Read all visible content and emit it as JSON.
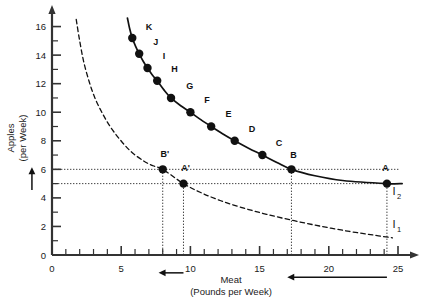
{
  "chart_data": {
    "type": "line",
    "title": "",
    "xlabel": "Meat",
    "xlabel_sub": "(Pounds per Week)",
    "ylabel": "Apples",
    "ylabel_sub": "(per Week)",
    "xlim": [
      0,
      25
    ],
    "ylim": [
      0,
      16.6
    ],
    "x_ticks_major": [
      0,
      5,
      10,
      15,
      20,
      25
    ],
    "x_tick_labels": [
      "0",
      "5",
      "10",
      "15",
      "20",
      "25"
    ],
    "x_tick_step_minor": 1,
    "y_ticks_major": [
      0,
      2,
      4,
      6,
      8,
      10,
      12,
      14,
      16
    ],
    "y_tick_labels": [
      "0",
      "2",
      "4",
      "6",
      "8",
      "10",
      "12",
      "14",
      "16"
    ],
    "y_tick_step_minor": 1,
    "grid": false,
    "legend": "none",
    "series": [
      {
        "name": "I2",
        "label": "I",
        "label_sub": "2",
        "style": "solid",
        "color": "#111111",
        "label_x": 24.6,
        "label_y": 4.2,
        "path": [
          [
            5.45,
            16.6
          ],
          [
            5.6,
            15.9
          ],
          [
            5.8,
            15.2
          ],
          [
            6.05,
            14.6
          ],
          [
            6.3,
            14.1
          ],
          [
            6.6,
            13.55
          ],
          [
            6.9,
            13.1
          ],
          [
            7.25,
            12.6
          ],
          [
            7.6,
            12.2
          ],
          [
            8.1,
            11.55
          ],
          [
            8.6,
            11.0
          ],
          [
            9.3,
            10.45
          ],
          [
            10.0,
            10.0
          ],
          [
            10.75,
            9.48
          ],
          [
            11.5,
            9.0
          ],
          [
            12.35,
            8.48
          ],
          [
            13.2,
            8.0
          ],
          [
            14.2,
            7.48
          ],
          [
            15.2,
            7.0
          ],
          [
            16.25,
            6.48
          ],
          [
            17.3,
            6.0
          ],
          [
            19.0,
            5.55
          ],
          [
            21.0,
            5.22
          ],
          [
            24.2,
            5.0
          ],
          [
            25.3,
            5.0
          ]
        ],
        "points": [
          {
            "label": "K",
            "x": 5.8,
            "y": 15.2,
            "lx": 7.0,
            "ly": 15.75
          },
          {
            "label": "J",
            "x": 6.3,
            "y": 14.1,
            "lx": 7.5,
            "ly": 14.7
          },
          {
            "label": "I",
            "x": 6.9,
            "y": 13.1,
            "lx": 8.1,
            "ly": 13.7
          },
          {
            "label": "H",
            "x": 7.6,
            "y": 12.2,
            "lx": 8.85,
            "ly": 12.8
          },
          {
            "label": "G",
            "x": 8.6,
            "y": 11.0,
            "lx": 9.95,
            "ly": 11.65
          },
          {
            "label": "F",
            "x": 10.0,
            "y": 10.0,
            "lx": 11.2,
            "ly": 10.65
          },
          {
            "label": "E",
            "x": 11.5,
            "y": 9.0,
            "lx": 12.75,
            "ly": 9.65
          },
          {
            "label": "D",
            "x": 13.2,
            "y": 8.0,
            "lx": 14.45,
            "ly": 8.65
          },
          {
            "label": "C",
            "x": 15.2,
            "y": 7.0,
            "lx": 16.4,
            "ly": 7.65
          },
          {
            "label": "B",
            "x": 17.3,
            "y": 6.0,
            "lx": 17.45,
            "ly": 6.8
          },
          {
            "label": "A",
            "x": 24.2,
            "y": 5.0,
            "lx": 24.1,
            "ly": 5.85
          }
        ]
      },
      {
        "name": "I1",
        "label": "I",
        "label_sub": "1",
        "style": "dashed",
        "color": "#111111",
        "label_x": 24.6,
        "label_y": 1.9,
        "path": [
          [
            1.75,
            16.5
          ],
          [
            2.0,
            15.0
          ],
          [
            2.3,
            13.5
          ],
          [
            2.7,
            12.1
          ],
          [
            3.1,
            11.0
          ],
          [
            3.6,
            10.0
          ],
          [
            4.2,
            9.0
          ],
          [
            4.9,
            8.1
          ],
          [
            5.7,
            7.25
          ],
          [
            6.6,
            6.6
          ],
          [
            7.3,
            6.25
          ],
          [
            8.0,
            6.0
          ],
          [
            9.5,
            5.0
          ],
          [
            10.8,
            4.35
          ],
          [
            12.2,
            3.8
          ],
          [
            13.8,
            3.3
          ],
          [
            15.5,
            2.85
          ],
          [
            17.5,
            2.4
          ],
          [
            19.5,
            2.0
          ],
          [
            21.5,
            1.65
          ],
          [
            23.2,
            1.4
          ],
          [
            24.6,
            1.2
          ]
        ],
        "points": [
          {
            "label": "B'",
            "x": 8.0,
            "y": 6.0,
            "lx": 8.15,
            "ly": 6.85
          },
          {
            "label": "A'",
            "x": 9.5,
            "y": 5.0,
            "lx": 9.65,
            "ly": 5.85
          }
        ]
      }
    ],
    "guide_lines_horizontal": [
      {
        "y": 6.0,
        "x_from": 0,
        "x_to": 25.1
      },
      {
        "y": 5.0,
        "x_from": 0,
        "x_to": 25.1
      }
    ],
    "guide_lines_vertical": [
      {
        "x": 8.0,
        "y_from": 0,
        "y_to": 6.0
      },
      {
        "x": 9.5,
        "y_from": 0,
        "y_to": 5.0
      },
      {
        "x": 17.3,
        "y_from": 0,
        "y_to": 6.0
      },
      {
        "x": 24.2,
        "y_from": 0,
        "y_to": 5.0
      }
    ],
    "annotations": [
      {
        "name": "y-axis-change-arrow",
        "type": "arrow-up",
        "x": -1.45,
        "y_from": 4.55,
        "y_to": 6.15
      },
      {
        "name": "meat-change-small-arrow",
        "type": "arrow-left",
        "y": -1.25,
        "x_from": 9.5,
        "x_to": 7.7
      },
      {
        "name": "meat-change-large-arrow",
        "type": "arrow-left",
        "y": -1.55,
        "x_from": 24.2,
        "x_to": 17.0
      }
    ]
  }
}
